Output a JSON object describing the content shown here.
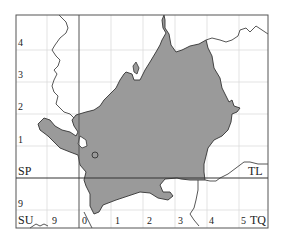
{
  "map": {
    "type": "distribution-map",
    "colors": {
      "background": "#ffffff",
      "frame": "#555555",
      "grid_minor": "#d8d8d8",
      "grid_major": "#333333",
      "region_fill": "#9a9a9a",
      "region_stroke": "#333333",
      "boundary": "#444444"
    },
    "grid_squares": {
      "top_left": "",
      "labels": [
        {
          "id": "SP",
          "text": "SP"
        },
        {
          "id": "TL",
          "text": "TL"
        },
        {
          "id": "SU",
          "text": "SU"
        },
        {
          "id": "TQ",
          "text": "TQ"
        }
      ]
    },
    "left_axis_labels": [
      "4",
      "3",
      "2",
      "1",
      "9"
    ],
    "bottom_axis_labels": [
      "9",
      "0",
      "1",
      "2",
      "3",
      "4",
      "5"
    ],
    "marker": {
      "shape": "circle",
      "label": "point-record"
    }
  }
}
